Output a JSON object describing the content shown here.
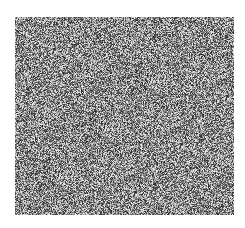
{
  "image": {
    "description": "grayscale random noise field",
    "background_color": "#ffffff",
    "noise_region": {
      "x": 15,
      "y": 17,
      "width": 219,
      "height": 198
    },
    "noise_mean_color": "#8a8a8a"
  }
}
